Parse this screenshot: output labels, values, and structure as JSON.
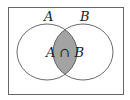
{
  "diagram": {
    "type": "venn",
    "sets": [
      {
        "label": "A"
      },
      {
        "label": "B"
      }
    ],
    "intersection_label": "A ∩ B",
    "colors": {
      "background": "#ffffff",
      "outline": "#555555",
      "intersection_fill": "#a3a3a3"
    }
  }
}
